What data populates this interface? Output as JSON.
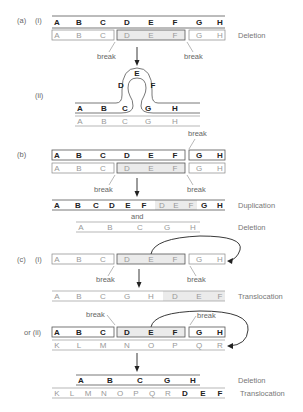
{
  "panels": {
    "a": {
      "label": "(a)",
      "sub_i": "(i)",
      "sub_ii": "(ii)",
      "row1": [
        "A",
        "B",
        "C",
        "D",
        "E",
        "F",
        "G",
        "H"
      ],
      "row2": [
        "A",
        "B",
        "C",
        "D",
        "E",
        "F",
        "G",
        "H"
      ],
      "result_label": "Deletion",
      "break_left": "break",
      "break_right": "break",
      "loop_top": [
        "A",
        "B",
        "C",
        "G",
        "H"
      ],
      "loop_genes": [
        "D",
        "E",
        "F"
      ],
      "loop_bottom": [
        "A",
        "B",
        "C",
        "G",
        "H"
      ]
    },
    "b": {
      "label": "(b)",
      "row1": [
        "A",
        "B",
        "C",
        "D",
        "E",
        "F",
        "G",
        "H"
      ],
      "row2": [
        "A",
        "B",
        "C",
        "D",
        "E",
        "F",
        "G",
        "H"
      ],
      "break_top": "break",
      "break_left": "break",
      "break_right": "break",
      "dup_row": [
        "A",
        "B",
        "C",
        "D",
        "E",
        "F",
        "D",
        "E",
        "F",
        "G",
        "H"
      ],
      "dup_label": "Duplication",
      "and": "and",
      "del_row": [
        "A",
        "B",
        "C",
        "G",
        "H"
      ],
      "del_label": "Deletion"
    },
    "c": {
      "label": "(c)",
      "sub_i": "(i)",
      "row_i": [
        "A",
        "B",
        "C",
        "D",
        "E",
        "F",
        "G",
        "H"
      ],
      "break_left": "break",
      "break_right": "break",
      "trans_row": [
        "A",
        "B",
        "C",
        "G",
        "H",
        "D",
        "E",
        "F"
      ],
      "trans_label": "Translocation",
      "or_ii": "or (ii)",
      "row_ii_top": [
        "A",
        "B",
        "C",
        "D",
        "E",
        "F",
        "G",
        "H"
      ],
      "row_ii_bottom": [
        "K",
        "L",
        "M",
        "N",
        "O",
        "P",
        "Q",
        "R"
      ],
      "break_ii_left": "break",
      "break_ii_right": "break",
      "result_del": [
        "A",
        "B",
        "C",
        "G",
        "H"
      ],
      "result_del_label": "Deletion",
      "result_trans": [
        "K",
        "L",
        "M",
        "N",
        "O",
        "P",
        "Q",
        "R",
        "D",
        "E",
        "F"
      ],
      "result_trans_label": "Translocation"
    }
  }
}
